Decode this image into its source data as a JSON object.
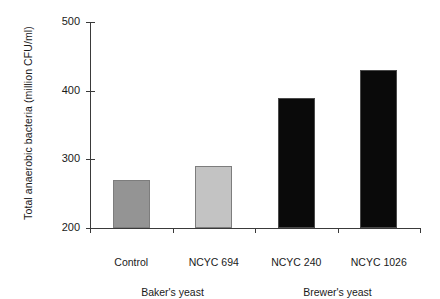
{
  "chart_data": {
    "type": "bar",
    "title": "",
    "subtitle": "",
    "xlabel": "",
    "ylabel": "Total anaerobic bacteria (million CFU/ml)",
    "categories": [
      "Control",
      "NCYC 694",
      "NCYC 240",
      "NCYC 1026"
    ],
    "values": [
      270,
      290,
      390,
      430
    ],
    "bar_colors": [
      "#949494",
      "#c3c3c3",
      "#0a0a0a",
      "#0a0a0a"
    ],
    "ylim": [
      200,
      500
    ],
    "yticks": [
      200,
      300,
      400,
      500
    ],
    "ytick_labels": [
      "200",
      "300",
      "400",
      "500"
    ],
    "grid": false,
    "legend": null,
    "groups": [
      {
        "label": "Baker's yeast",
        "categories": [
          "Control",
          "NCYC 694"
        ]
      },
      {
        "label": "Brewer's yeast",
        "categories": [
          "NCYC 240",
          "NCYC 1026"
        ]
      }
    ]
  },
  "colors": {
    "axis": "#3a3a3a",
    "text": "#1a1a1a",
    "background": "#ffffff",
    "bar_light_gray": "#c3c3c3",
    "bar_mid_gray": "#949494",
    "bar_black": "#0a0a0a"
  }
}
